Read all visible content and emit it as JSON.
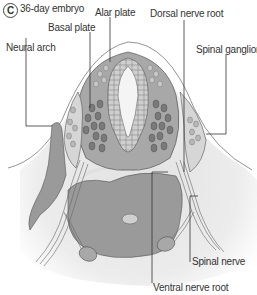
{
  "panel": {
    "letter": "C",
    "title": "36-day embryo"
  },
  "labels": {
    "alar_plate": "Alar plate",
    "basal_plate": "Basal plate",
    "dorsal_nerve_root": "Dorsal nerve root",
    "neural_arch": "Neural arch",
    "spinal_ganglion": "Spinal ganglion",
    "spinal_nerve": "Spinal nerve",
    "ventral_nerve_root": "Ventral nerve root"
  },
  "colors": {
    "tissue_dark": "#8a8a8a",
    "tissue_mid": "#a8a8a8",
    "tissue_light": "#d6d6d6",
    "background_haze": "#e8e8e8",
    "line": "#444444"
  }
}
